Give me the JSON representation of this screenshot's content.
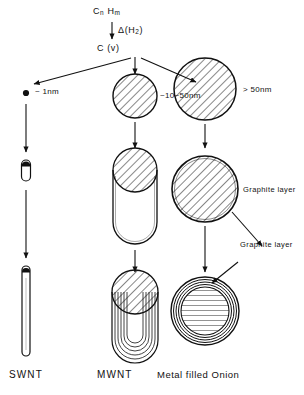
{
  "figure": {
    "type": "process-flow-diagram",
    "background_color": "#ffffff",
    "ink_color": "#111111"
  },
  "precursor": {
    "formula_c": "C",
    "formula_c_sub": "n",
    "formula_h": "H",
    "formula_h_sub": "m",
    "reaction_symbol": "Δ",
    "reaction_gas_open": "(H",
    "reaction_gas_sub": "2",
    "reaction_gas_close": ")",
    "product_label": "C (v)"
  },
  "branches": [
    {
      "id": "left",
      "size_label": "~ 1nm",
      "bottom_label": "SWNT",
      "stages": [
        "dot",
        "small-capsule",
        "long-tube"
      ]
    },
    {
      "id": "middle",
      "size_label": "~10~50nm",
      "bottom_label": "MWNT",
      "stages": [
        "hatched-circle",
        "capsule-with-cap",
        "multiwall-u-tube"
      ]
    },
    {
      "id": "right",
      "size_label": "> 50nm",
      "bottom_label": "Metal filled Onion",
      "stages": [
        "large-hatched-circle",
        "shelled-circle",
        "onion"
      ]
    }
  ],
  "annotations": [
    {
      "id": "graphite-upper",
      "text": "Graphite layer"
    },
    {
      "id": "graphite-lower",
      "text": "Graphite layer"
    }
  ]
}
